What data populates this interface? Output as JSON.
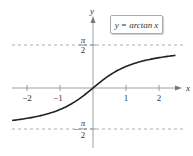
{
  "chart_data": {
    "type": "line",
    "title": "",
    "legend": [
      "y = arctan x"
    ],
    "legend_position": "top-right",
    "xlabel": "x",
    "ylabel": "y",
    "xlim": [
      -2.5,
      2.6
    ],
    "ylim": [
      -2.0,
      2.5
    ],
    "x_ticks": [
      -2,
      -1,
      1,
      2
    ],
    "x_tick_labels": [
      "−2",
      "−1",
      "1",
      "2"
    ],
    "y_ticks": [
      1.5708,
      -1.5708
    ],
    "y_tick_labels": [
      "π/2",
      "−π/2"
    ],
    "asymptotes": [
      {
        "y": 1.5708,
        "style": "dashed",
        "label": "π/2"
      },
      {
        "y": -1.5708,
        "style": "dashed",
        "label": "−π/2"
      }
    ],
    "grid": false,
    "series": [
      {
        "name": "y = arctan x",
        "x": [
          -2.45,
          -2,
          -1.5,
          -1,
          -0.5,
          0,
          0.5,
          1,
          1.5,
          2,
          2.5
        ],
        "y": [
          -1.183,
          -1.107,
          -0.983,
          -0.785,
          -0.464,
          0,
          0.464,
          0.785,
          0.983,
          1.107,
          1.19
        ]
      }
    ]
  },
  "legend": {
    "prefix": "y = arctan ",
    "var": "x"
  },
  "axes": {
    "x_label": "x",
    "y_label": "y",
    "pi_num": "π",
    "pi_den": "2",
    "neg_sign": "−"
  },
  "ticks": {
    "x": [
      "−2",
      "−1",
      "1",
      "2"
    ]
  }
}
